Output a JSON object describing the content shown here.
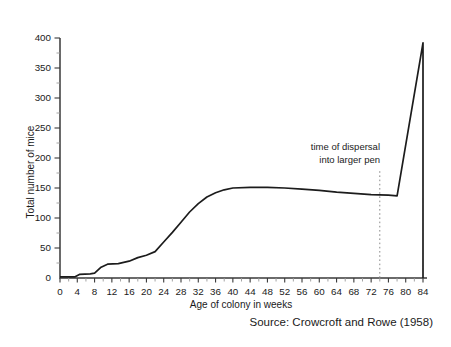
{
  "chart_data": {
    "type": "line",
    "title": "",
    "xlabel": "Age of colony in weeks",
    "ylabel": "Total number of mice",
    "source": "Source: Crowcroft and Rowe (1958)",
    "xlim": [
      0,
      84
    ],
    "ylim": [
      0,
      400
    ],
    "x_major_ticks": [
      0,
      4,
      8,
      12,
      16,
      20,
      24,
      28,
      32,
      36,
      40,
      44,
      48,
      52,
      56,
      60,
      64,
      68,
      72,
      76,
      80,
      84
    ],
    "x_minor_ticks": [
      2,
      6,
      10,
      14,
      18,
      22,
      26,
      30,
      34,
      38,
      42,
      46,
      50,
      54,
      58,
      62,
      66,
      70,
      74,
      78,
      82
    ],
    "y_major_ticks": [
      0,
      50,
      100,
      150,
      200,
      250,
      300,
      350,
      400
    ],
    "y_minor_ticks": [
      25,
      75,
      125,
      175,
      225,
      275,
      325,
      375
    ],
    "grid": false,
    "legend": "none",
    "line_color": "#1c1c1c",
    "axis_color": "#3a3a3a",
    "series": [
      {
        "name": "Total number of mice",
        "points": [
          [
            0,
            2
          ],
          [
            3.5,
            2
          ],
          [
            4.5,
            6
          ],
          [
            7,
            7
          ],
          [
            8,
            8
          ],
          [
            9.5,
            18
          ],
          [
            11,
            23
          ],
          [
            13.5,
            24
          ],
          [
            16,
            28
          ],
          [
            18,
            34
          ],
          [
            20,
            38
          ],
          [
            22,
            44
          ],
          [
            24,
            60
          ],
          [
            26,
            76
          ],
          [
            28,
            93
          ],
          [
            30,
            110
          ],
          [
            32,
            124
          ],
          [
            34,
            135
          ],
          [
            36,
            142
          ],
          [
            38,
            147
          ],
          [
            40,
            150
          ],
          [
            44,
            151
          ],
          [
            48,
            151
          ],
          [
            52,
            150
          ],
          [
            56,
            148
          ],
          [
            60,
            146
          ],
          [
            64,
            143
          ],
          [
            68,
            141
          ],
          [
            72,
            139
          ],
          [
            76,
            138
          ],
          [
            78,
            137
          ],
          [
            84,
            392
          ],
          [
            84,
            0
          ]
        ]
      }
    ],
    "annotation": {
      "label_line1": "time of dispersal",
      "label_line2": "into larger pen",
      "x_week": 74,
      "line_style": "dotted",
      "line_color": "#8a8a8a",
      "line_top_value": 178
    }
  }
}
